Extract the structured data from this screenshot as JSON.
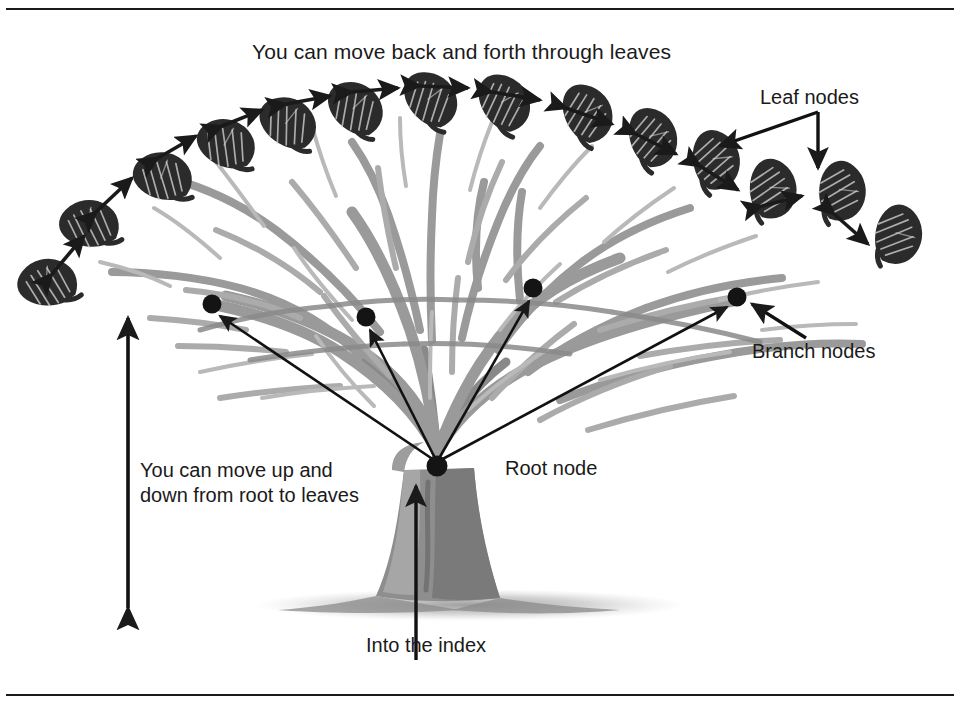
{
  "figure": {
    "kind": "b-tree-index-tree-diagram",
    "top_rule": true,
    "bottom_rule": true,
    "background_color": "#ffffff",
    "ink_color": "#1a1a1a",
    "branch_color": "#9a9a9a",
    "branch_shadow_color": "#777777",
    "trunk_color": "#8e8e8e",
    "leaf_color": "#2b2b2b"
  },
  "labels": {
    "title": "You can move back and forth through leaves",
    "leaf_nodes": "Leaf nodes",
    "branch_nodes": "Branch nodes",
    "root_node": "Root node",
    "up_down": "You can move up and\ndown from root to leaves",
    "into_the_index": "Into the index"
  },
  "nodes": {
    "root": {
      "label": "Root node",
      "x": 437,
      "y": 466,
      "r": 10
    },
    "branches": [
      {
        "label": "Branch node 1",
        "x": 212,
        "y": 304,
        "r": 9
      },
      {
        "label": "Branch node 2",
        "x": 366,
        "y": 317,
        "r": 9
      },
      {
        "label": "Branch node 3",
        "x": 533,
        "y": 288,
        "r": 9
      },
      {
        "label": "Branch node 4",
        "x": 737,
        "y": 297,
        "r": 9
      }
    ],
    "leaves": [
      {
        "x": 66,
        "y": 290,
        "rot": -52
      },
      {
        "x": 103,
        "y": 233,
        "rot": -46
      },
      {
        "x": 172,
        "y": 188,
        "rot": -36
      },
      {
        "x": 232,
        "y": 157,
        "rot": -27
      },
      {
        "x": 290,
        "y": 137,
        "rot": -18
      },
      {
        "x": 355,
        "y": 123,
        "rot": -10
      },
      {
        "x": 428,
        "y": 114,
        "rot": -4
      },
      {
        "x": 498,
        "y": 117,
        "rot": 4
      },
      {
        "x": 578,
        "y": 127,
        "rot": 11
      },
      {
        "x": 640,
        "y": 150,
        "rot": 19
      },
      {
        "x": 700,
        "y": 171,
        "rot": 27
      },
      {
        "x": 752,
        "y": 198,
        "rot": 35
      },
      {
        "x": 820,
        "y": 199,
        "rot": 40
      },
      {
        "x": 872,
        "y": 240,
        "rot": 48
      }
    ]
  },
  "arrows": {
    "leaf_chain_double_headed": 13,
    "root_to_branch": 4,
    "into_index_vertical": 1,
    "updown_double_headed": {
      "x": 128,
      "y_top": 318,
      "y_bottom": 608
    },
    "leaf_nodes_pointers": 2,
    "branch_nodes_pointer": 1
  }
}
